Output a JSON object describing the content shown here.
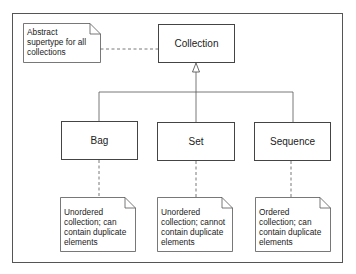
{
  "diagram": {
    "type": "UML class diagram",
    "classes": {
      "collection": "Collection",
      "bag": "Bag",
      "set": "Set",
      "sequence": "Sequence"
    },
    "notes": {
      "collection": [
        "Abstract",
        "supertype for all",
        "collections"
      ],
      "bag": [
        "Unordered",
        "collection; can",
        "contain duplicate",
        "elements"
      ],
      "set": [
        "Unordered",
        "collection; cannot",
        "contain duplicate",
        "elements"
      ],
      "sequence": [
        "Ordered",
        "collection; can",
        "contain duplicate",
        "elements"
      ]
    },
    "relationships": [
      {
        "kind": "generalization",
        "from": "Bag",
        "to": "Collection"
      },
      {
        "kind": "generalization",
        "from": "Set",
        "to": "Collection"
      },
      {
        "kind": "generalization",
        "from": "Sequence",
        "to": "Collection"
      },
      {
        "kind": "note-anchor",
        "from": "collection-note",
        "to": "Collection"
      },
      {
        "kind": "note-anchor",
        "from": "bag-note",
        "to": "Bag"
      },
      {
        "kind": "note-anchor",
        "from": "set-note",
        "to": "Set"
      },
      {
        "kind": "note-anchor",
        "from": "sequence-note",
        "to": "Sequence"
      }
    ]
  }
}
